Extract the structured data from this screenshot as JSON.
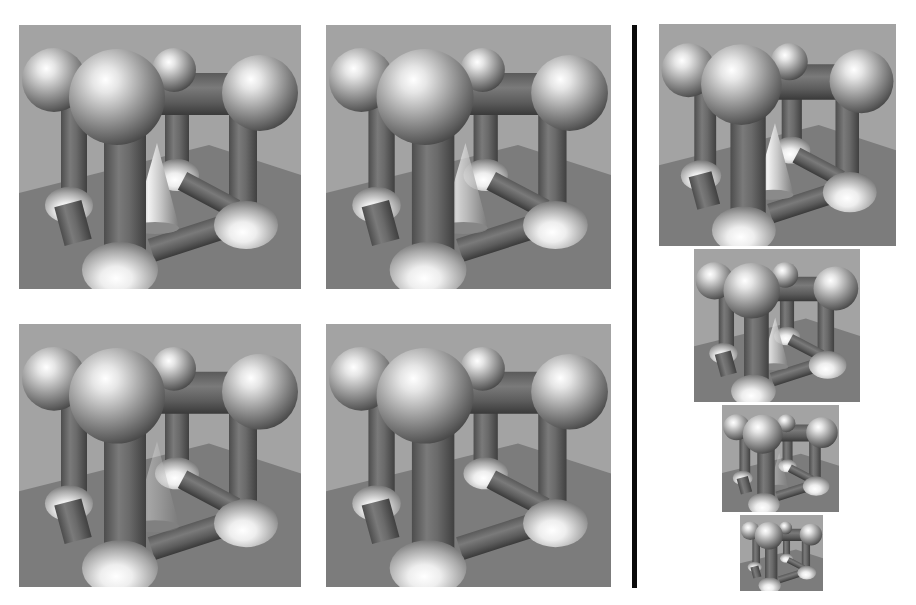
{
  "figure": {
    "divider_color": "#0a0a0a",
    "background_color": "#ffffff",
    "scene_colors": {
      "wall": "#a3a3a3",
      "floor": "#7c7c7c",
      "cylinder": "#6e6e6e",
      "sphere_highlight": "#ffffff",
      "sphere_shadow": "#4a4a4a"
    },
    "left_grid": [
      {
        "id": "top-left",
        "x": 19,
        "y": 25,
        "w": 282,
        "h": 264,
        "cone_visible": true,
        "cone_opacity": 1.0
      },
      {
        "id": "top-right",
        "x": 326,
        "y": 25,
        "w": 285,
        "h": 264,
        "cone_visible": true,
        "cone_opacity": 0.75
      },
      {
        "id": "bottom-left",
        "x": 19,
        "y": 324,
        "w": 282,
        "h": 263,
        "cone_visible": true,
        "cone_opacity": 0.35
      },
      {
        "id": "bottom-right",
        "x": 326,
        "y": 324,
        "w": 285,
        "h": 263,
        "cone_visible": false,
        "cone_opacity": 0.0
      }
    ],
    "divider": {
      "x": 632,
      "y": 25,
      "w": 5,
      "h": 563
    },
    "right_column": [
      {
        "id": "res-1",
        "x": 659,
        "y": 24,
        "w": 237,
        "h": 222,
        "cone_opacity": 1.0
      },
      {
        "id": "res-2",
        "x": 694,
        "y": 249,
        "w": 166,
        "h": 153,
        "cone_opacity": 0.8
      },
      {
        "id": "res-3",
        "x": 722,
        "y": 405,
        "w": 117,
        "h": 107,
        "cone_opacity": 0.3
      },
      {
        "id": "res-4",
        "x": 740,
        "y": 515,
        "w": 83,
        "h": 76,
        "cone_opacity": 0.0
      }
    ]
  }
}
